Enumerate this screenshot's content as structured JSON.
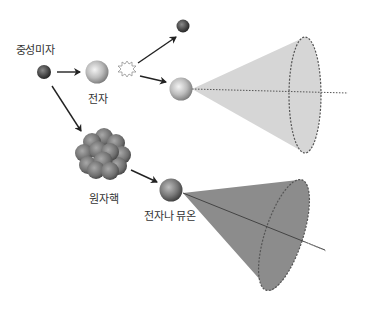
{
  "labels": {
    "neutrino": "중성미자",
    "electron": "전자",
    "nucleus": "원자핵",
    "electron_or_muon": "전자나 뮤온"
  },
  "colors": {
    "background": "#ffffff",
    "arrow": "#222222",
    "light_cone_fill": "#d4d4d4",
    "dark_cone_fill": "#8a8a8a",
    "cone_outline": "#555555",
    "axis_line": "#666666",
    "neutrino_sphere": "#4a4a4a",
    "electron_sphere": "#bdbdbd",
    "nucleus_sphere": "#7a7a7a"
  }
}
